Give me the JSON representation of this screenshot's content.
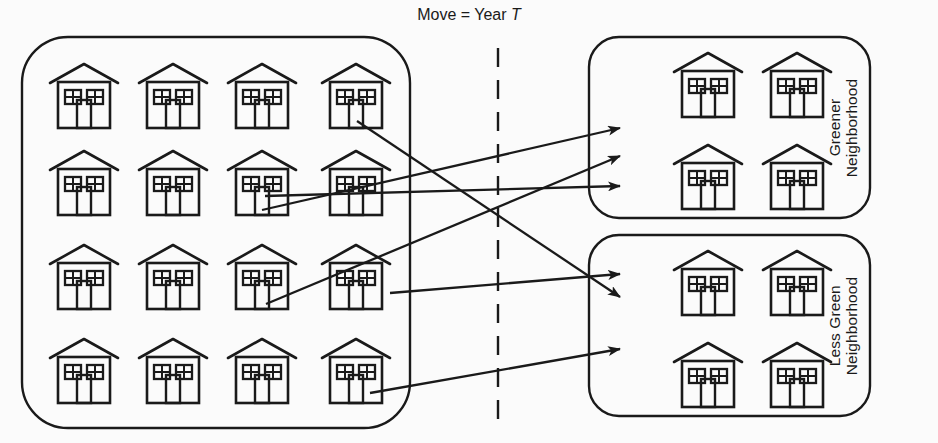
{
  "title": {
    "text": "Move = Year",
    "variable": "T",
    "full": "Move = Year T"
  },
  "colors": {
    "stroke": "#1a1a1a",
    "background": "#fbfbfb",
    "text": "#1a1a1a"
  },
  "groups": [
    {
      "id": "origin-neighborhood",
      "name": "origin-neighborhood",
      "label": "",
      "house_count": 16,
      "rows": 4,
      "cols": 4,
      "box": {
        "x": 22,
        "y": 37,
        "w": 388,
        "h": 391,
        "radius": 46
      }
    },
    {
      "id": "greener-neighborhood",
      "name": "greener-neighborhood",
      "label": "Greener\nNeighborhood",
      "house_count": 4,
      "rows": 2,
      "cols": 2,
      "box": {
        "x": 589,
        "y": 37,
        "w": 281,
        "h": 181,
        "radius": 30
      },
      "label_pos": {
        "x": 843,
        "y": 128
      }
    },
    {
      "id": "less-green-neighborhood",
      "name": "less-green-neighborhood",
      "label": "Less Green\nNeighborhood",
      "house_count": 4,
      "rows": 2,
      "cols": 2,
      "box": {
        "x": 589,
        "y": 235,
        "w": 281,
        "h": 181,
        "radius": 30
      },
      "label_pos": {
        "x": 843,
        "y": 326
      }
    }
  ],
  "divider": {
    "name": "vertical-dashed-divider",
    "x": 498,
    "y1": 48,
    "y2": 432,
    "dash": "19,13"
  },
  "houses": {
    "origin": [
      {
        "cx": 84,
        "cy": 96
      },
      {
        "cx": 173,
        "cy": 96
      },
      {
        "cx": 262,
        "cy": 96
      },
      {
        "cx": 356,
        "cy": 96
      },
      {
        "cx": 84,
        "cy": 183
      },
      {
        "cx": 173,
        "cy": 183
      },
      {
        "cx": 262,
        "cy": 183
      },
      {
        "cx": 356,
        "cy": 183
      },
      {
        "cx": 84,
        "cy": 277
      },
      {
        "cx": 173,
        "cy": 277
      },
      {
        "cx": 262,
        "cy": 277
      },
      {
        "cx": 356,
        "cy": 277
      },
      {
        "cx": 84,
        "cy": 371
      },
      {
        "cx": 173,
        "cy": 371
      },
      {
        "cx": 262,
        "cy": 371
      },
      {
        "cx": 356,
        "cy": 371
      }
    ],
    "greener": [
      {
        "cx": 708,
        "cy": 85
      },
      {
        "cx": 797,
        "cy": 85
      },
      {
        "cx": 708,
        "cy": 177
      },
      {
        "cx": 797,
        "cy": 177
      }
    ],
    "less_green": [
      {
        "cx": 708,
        "cy": 283
      },
      {
        "cx": 797,
        "cy": 283
      },
      {
        "cx": 708,
        "cy": 375
      },
      {
        "cx": 797,
        "cy": 375
      }
    ]
  },
  "house_glyph": {
    "name": "house-icon",
    "width": 72,
    "height": 68
  },
  "arrows": [
    {
      "name": "arrow-to-less-green-1",
      "x1": 357,
      "y1": 121,
      "x2": 620,
      "y2": 297,
      "target": "less-green-neighborhood"
    },
    {
      "name": "arrow-to-greener-1",
      "x1": 265,
      "y1": 196,
      "x2": 620,
      "y2": 186,
      "target": "greener-neighborhood"
    },
    {
      "name": "arrow-to-greener-2",
      "x1": 262,
      "y1": 210,
      "x2": 620,
      "y2": 128,
      "target": "greener-neighborhood"
    },
    {
      "name": "arrow-to-greener-3",
      "x1": 266,
      "y1": 304,
      "x2": 620,
      "y2": 156,
      "target": "greener-neighborhood"
    },
    {
      "name": "arrow-to-less-green-2",
      "x1": 390,
      "y1": 293,
      "x2": 620,
      "y2": 274,
      "target": "less-green-neighborhood"
    },
    {
      "name": "arrow-to-less-green-3",
      "x1": 370,
      "y1": 393,
      "x2": 620,
      "y2": 349,
      "target": "less-green-neighborhood"
    }
  ]
}
